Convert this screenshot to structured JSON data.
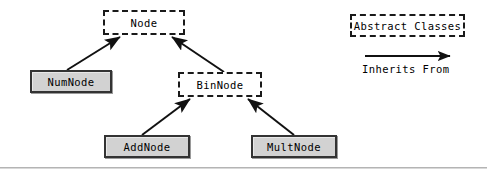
{
  "diagram": {
    "type": "uml-class-hierarchy",
    "nodes": [
      {
        "id": "node",
        "label": "Node",
        "kind": "abstract",
        "x": 103,
        "y": 10,
        "w": 82,
        "h": 25
      },
      {
        "id": "numnode",
        "label": "NumNode",
        "kind": "concrete",
        "x": 30,
        "y": 70,
        "w": 82,
        "h": 23
      },
      {
        "id": "binnode",
        "label": "BinNode",
        "kind": "abstract",
        "x": 178,
        "y": 72,
        "w": 84,
        "h": 25
      },
      {
        "id": "addnode",
        "label": "AddNode",
        "kind": "concrete",
        "x": 104,
        "y": 135,
        "w": 86,
        "h": 23
      },
      {
        "id": "multnode",
        "label": "MultNode",
        "kind": "concrete",
        "x": 251,
        "y": 135,
        "w": 86,
        "h": 23
      }
    ],
    "edges": [
      {
        "from": "numnode",
        "to": "node",
        "relation": "Inherits From",
        "x1": 67,
        "y1": 70,
        "x2": 120,
        "y2": 37
      },
      {
        "from": "binnode",
        "to": "node",
        "relation": "Inherits From",
        "x1": 224,
        "y1": 72,
        "x2": 172,
        "y2": 37
      },
      {
        "from": "addnode",
        "to": "binnode",
        "relation": "Inherits From",
        "x1": 142,
        "y1": 135,
        "x2": 190,
        "y2": 99
      },
      {
        "from": "multnode",
        "to": "binnode",
        "relation": "Inherits From",
        "x1": 294,
        "y1": 135,
        "x2": 248,
        "y2": 99
      }
    ]
  },
  "legend": {
    "abstract_label": "Abstract Classes",
    "abstract_box": {
      "x": 350,
      "y": 14,
      "w": 115,
      "h": 23
    },
    "arrow_label": "Inherits From",
    "arrow": {
      "x1": 365,
      "y1": 56,
      "x2": 452,
      "y2": 56
    },
    "caption_position": {
      "x": 362,
      "y": 63
    }
  },
  "style": {
    "abstract_fill": "#ffffff",
    "abstract_border": "#1a1a1a",
    "concrete_fill": "#d2d2d2",
    "concrete_border": "#333333",
    "edge_color": "#111111",
    "text_color": "#000000",
    "page_background": "#ffffff",
    "rule_color": "#b4b4b4"
  },
  "footer_rule": {
    "y": 167
  }
}
